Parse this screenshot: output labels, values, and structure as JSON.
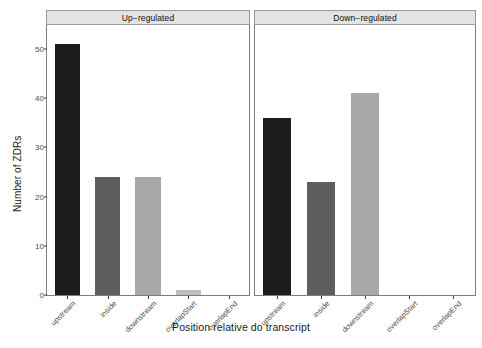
{
  "chart_data": {
    "type": "bar",
    "title": "",
    "xlabel": "Position relative do transcript",
    "ylabel": "Number of ZDRs",
    "categories": [
      "upstream",
      "inside",
      "downstream",
      "overlapStart",
      "overlapEnd"
    ],
    "ylim": [
      0,
      53
    ],
    "yticks": [
      0,
      10,
      20,
      30,
      40,
      50
    ],
    "ytick_labels": [
      "0",
      "10",
      "20",
      "30",
      "40",
      "50"
    ],
    "grid": false,
    "legend": "none",
    "facets": [
      {
        "label": "Up−regulated",
        "values": [
          51,
          24,
          24,
          1,
          0
        ]
      },
      {
        "label": "Down−regulated",
        "values": [
          36,
          23,
          41,
          0,
          0
        ]
      }
    ],
    "bar_colors": [
      "#1c1c1c",
      "#5e5e5e",
      "#a8a8a8",
      "#bdbdbd",
      "#bdbdbd"
    ],
    "panel_strip_color": "#e3e3e3",
    "panel_border_color": "#7d7d7d",
    "axis_text_color": "#4d4d4d"
  }
}
